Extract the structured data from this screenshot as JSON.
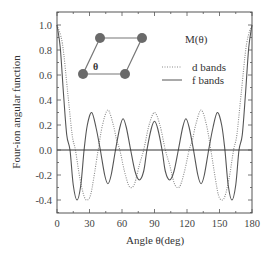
{
  "chart_data": {
    "type": "line",
    "title": "",
    "xlabel": "Angle θ(deg)",
    "ylabel": "Four-ion angular function",
    "xlim": [
      0,
      180
    ],
    "ylim": [
      -0.5,
      1.1
    ],
    "xticks": [
      0,
      30,
      60,
      90,
      120,
      150,
      180
    ],
    "xtick_labels": [
      "0",
      "30",
      "60",
      "90",
      "120",
      "150",
      "180"
    ],
    "yticks": [
      -0.4,
      -0.2,
      0.0,
      0.2,
      0.4,
      0.6,
      0.8,
      1.0
    ],
    "ytick_labels": [
      "-0.4",
      "-0.2",
      "0.0",
      "0.2",
      "0.4",
      "0.6",
      "0.8",
      "1.0"
    ],
    "grid": false,
    "zero_line": true,
    "legend_title": "M(θ)",
    "legend_position": "upper right (inside)",
    "series": [
      {
        "name": "d bands",
        "style": "dotted",
        "color": "#8a8a8a",
        "x": [
          0,
          5,
          10,
          14,
          17,
          21,
          25,
          28,
          31,
          34,
          38,
          42,
          47,
          52,
          55,
          58,
          62,
          66,
          69,
          72,
          76,
          80,
          85,
          90,
          95,
          100,
          104,
          108,
          111,
          114,
          118,
          122,
          125,
          128,
          133,
          138,
          142,
          146,
          149,
          152,
          155,
          159,
          163,
          166,
          170,
          175,
          180
        ],
        "y": [
          1.0,
          0.85,
          0.45,
          0.12,
          0.0,
          -0.22,
          -0.37,
          -0.4,
          -0.36,
          -0.22,
          0.0,
          0.2,
          0.32,
          0.2,
          0.08,
          0.0,
          -0.16,
          -0.28,
          -0.3,
          -0.26,
          -0.12,
          0.0,
          0.2,
          0.3,
          0.2,
          0.0,
          -0.12,
          -0.26,
          -0.3,
          -0.28,
          -0.16,
          0.0,
          0.08,
          0.2,
          0.32,
          0.2,
          0.0,
          -0.22,
          -0.36,
          -0.4,
          -0.37,
          -0.22,
          0.0,
          0.12,
          0.45,
          0.85,
          1.0
        ]
      },
      {
        "name": "f bands",
        "style": "solid",
        "color": "#555555",
        "x": [
          0,
          3,
          6,
          9,
          12,
          15,
          18.5,
          22,
          25,
          28,
          32,
          36,
          40,
          44,
          47,
          50,
          54,
          58,
          61,
          64,
          68,
          72,
          76,
          80,
          83,
          87,
          90,
          93,
          97,
          100,
          104,
          108,
          112,
          116,
          119,
          122,
          126,
          130,
          133,
          136,
          140,
          144,
          148,
          152,
          155,
          158,
          161.5,
          165,
          168,
          171,
          174,
          177,
          180
        ],
        "y": [
          1.0,
          0.82,
          0.45,
          0.12,
          0.0,
          -0.28,
          -0.4,
          -0.28,
          0.0,
          0.2,
          0.3,
          0.18,
          0.0,
          -0.2,
          -0.27,
          -0.2,
          0.0,
          0.18,
          0.25,
          0.18,
          0.0,
          -0.17,
          -0.24,
          -0.17,
          0.0,
          0.17,
          0.23,
          0.17,
          0.0,
          -0.17,
          -0.24,
          -0.17,
          0.0,
          0.18,
          0.25,
          0.18,
          0.0,
          -0.2,
          -0.27,
          -0.2,
          0.0,
          0.18,
          0.3,
          0.2,
          0.0,
          -0.28,
          -0.4,
          -0.28,
          0.0,
          0.12,
          0.45,
          0.82,
          1.0
        ]
      }
    ],
    "inset": {
      "description": "rhombic four-ion plaquette with angle θ",
      "angle_label": "θ",
      "node_color": "#666666"
    }
  },
  "legend": {
    "title": "M(θ)",
    "items": [
      {
        "label": "d bands",
        "style": "dotted"
      },
      {
        "label": "f bands",
        "style": "solid"
      }
    ]
  },
  "axes": {
    "xlabel": "Angle θ(deg)",
    "ylabel": "Four-ion angular function"
  }
}
